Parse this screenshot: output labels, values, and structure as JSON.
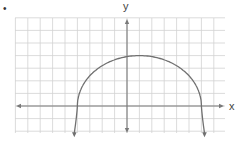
{
  "bullet": "•",
  "chart_data": {
    "type": "line",
    "title": "",
    "xlabel": "x",
    "ylabel": "y",
    "grid": true,
    "grid_unit": 1,
    "xlim": [
      -9,
      8
    ],
    "ylim": [
      -2,
      7
    ],
    "axes_arrows": true,
    "series": [
      {
        "name": "curve",
        "description": "Downward-opening arch (upper part of an ellipse) with arrowheads on both ends pointing down",
        "x": [
          -4.2,
          -4,
          -3,
          -2,
          -1,
          0,
          1,
          2,
          3,
          4,
          5,
          6,
          6.2
        ],
        "y": [
          -2,
          0,
          1.9,
          2.9,
          3.5,
          3.9,
          4,
          3.9,
          3.5,
          2.9,
          1.9,
          0,
          -2
        ],
        "x_intercepts": [
          -4,
          6
        ],
        "max_point": [
          1,
          4
        ],
        "end_arrows": "both ends point downward"
      }
    ],
    "colors": {
      "grid": "#d2d2d2",
      "axis": "#7a7a7a",
      "curve": "#707070"
    }
  }
}
